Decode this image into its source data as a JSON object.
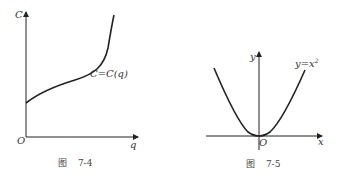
{
  "figures": [
    {
      "id": "fig-7-4",
      "caption_prefix": "图",
      "caption_number": "7-4",
      "y_axis_label": "C",
      "x_axis_label": "q",
      "origin_label": "O",
      "curve_label": "C=C(q)"
    },
    {
      "id": "fig-7-5",
      "caption_prefix": "图",
      "caption_number": "7-5",
      "y_axis_label": "y",
      "x_axis_label": "x",
      "origin_label": "O",
      "curve_label_base": "y=x",
      "curve_label_exp": "2"
    }
  ],
  "colors": {
    "ink": "#222222",
    "caption": "#444444",
    "background": "#ffffff"
  }
}
